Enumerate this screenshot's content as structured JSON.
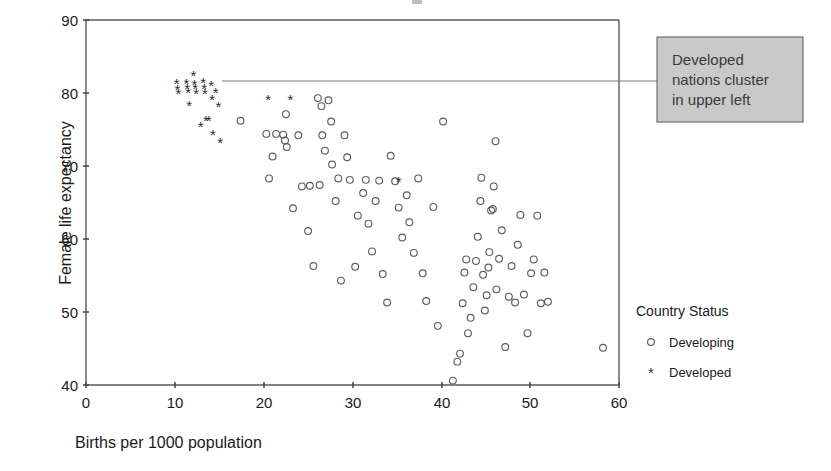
{
  "chart_data": {
    "type": "scatter",
    "title": "",
    "xlabel": "Births per 1000 population",
    "ylabel": "Female life expectancy",
    "xlim": [
      0,
      60
    ],
    "ylim": [
      40,
      90
    ],
    "xticks": [
      0,
      10,
      20,
      30,
      40,
      50,
      60
    ],
    "yticks": [
      40,
      50,
      60,
      70,
      80,
      90
    ],
    "grid": false,
    "legend_position": "right",
    "legend_title": "Country Status",
    "series": [
      {
        "name": "Developing",
        "marker": "circle",
        "color": "#5f5f5f",
        "points": [
          [
            17.4,
            76.2
          ],
          [
            20.3,
            74.4
          ],
          [
            20.6,
            68.3
          ],
          [
            21.0,
            71.3
          ],
          [
            21.4,
            74.4
          ],
          [
            22.2,
            74.3
          ],
          [
            22.4,
            73.5
          ],
          [
            22.5,
            77.1
          ],
          [
            22.6,
            72.6
          ],
          [
            23.3,
            64.2
          ],
          [
            23.9,
            74.2
          ],
          [
            24.3,
            67.2
          ],
          [
            25.0,
            61.1
          ],
          [
            25.2,
            67.3
          ],
          [
            25.6,
            56.3
          ],
          [
            26.1,
            79.3
          ],
          [
            26.3,
            67.4
          ],
          [
            26.5,
            78.2
          ],
          [
            26.6,
            74.2
          ],
          [
            26.9,
            72.1
          ],
          [
            27.3,
            79.0
          ],
          [
            27.6,
            76.1
          ],
          [
            27.7,
            70.2
          ],
          [
            28.1,
            65.2
          ],
          [
            28.4,
            68.3
          ],
          [
            28.7,
            54.3
          ],
          [
            29.1,
            74.2
          ],
          [
            29.4,
            71.2
          ],
          [
            29.7,
            68.1
          ],
          [
            30.3,
            56.2
          ],
          [
            30.6,
            63.2
          ],
          [
            31.2,
            66.3
          ],
          [
            31.5,
            68.1
          ],
          [
            31.8,
            62.1
          ],
          [
            32.2,
            58.3
          ],
          [
            32.6,
            65.2
          ],
          [
            33.0,
            68.0
          ],
          [
            33.4,
            55.2
          ],
          [
            33.9,
            51.3
          ],
          [
            34.3,
            71.4
          ],
          [
            34.8,
            67.9
          ],
          [
            35.2,
            64.3
          ],
          [
            35.6,
            60.2
          ],
          [
            36.1,
            66.0
          ],
          [
            36.4,
            62.3
          ],
          [
            36.9,
            58.1
          ],
          [
            37.4,
            68.3
          ],
          [
            37.9,
            55.3
          ],
          [
            38.3,
            51.5
          ],
          [
            39.1,
            64.4
          ],
          [
            39.6,
            48.1
          ],
          [
            40.2,
            76.1
          ],
          [
            41.3,
            40.6
          ],
          [
            41.8,
            43.2
          ],
          [
            42.1,
            44.3
          ],
          [
            42.4,
            51.2
          ],
          [
            42.6,
            55.4
          ],
          [
            42.8,
            57.2
          ],
          [
            43.0,
            47.1
          ],
          [
            43.3,
            49.2
          ],
          [
            43.6,
            53.4
          ],
          [
            43.9,
            57.0
          ],
          [
            44.1,
            60.3
          ],
          [
            44.4,
            65.2
          ],
          [
            44.5,
            68.4
          ],
          [
            44.7,
            55.1
          ],
          [
            44.9,
            50.2
          ],
          [
            45.1,
            52.3
          ],
          [
            45.3,
            56.1
          ],
          [
            45.4,
            58.2
          ],
          [
            45.6,
            63.9
          ],
          [
            45.8,
            64.1
          ],
          [
            45.9,
            67.2
          ],
          [
            46.1,
            73.4
          ],
          [
            46.2,
            53.1
          ],
          [
            46.5,
            57.3
          ],
          [
            46.8,
            61.2
          ],
          [
            47.2,
            45.2
          ],
          [
            47.6,
            52.1
          ],
          [
            47.9,
            56.3
          ],
          [
            48.3,
            51.3
          ],
          [
            48.6,
            59.2
          ],
          [
            48.9,
            63.3
          ],
          [
            49.3,
            52.4
          ],
          [
            49.7,
            47.1
          ],
          [
            50.1,
            55.3
          ],
          [
            50.4,
            57.2
          ],
          [
            50.8,
            63.2
          ],
          [
            51.2,
            51.2
          ],
          [
            51.6,
            55.4
          ],
          [
            52.0,
            51.4
          ],
          [
            58.2,
            45.1
          ]
        ]
      },
      {
        "name": "Developed",
        "marker": "star",
        "color": "#2e2e2e",
        "points": [
          [
            10.2,
            81.2
          ],
          [
            10.3,
            80.4
          ],
          [
            10.4,
            79.9
          ],
          [
            11.3,
            81.3
          ],
          [
            11.4,
            80.6
          ],
          [
            11.5,
            80.0
          ],
          [
            11.6,
            78.2
          ],
          [
            12.1,
            82.3
          ],
          [
            12.2,
            81.1
          ],
          [
            12.3,
            80.5
          ],
          [
            12.4,
            79.9
          ],
          [
            12.9,
            75.3
          ],
          [
            13.2,
            81.4
          ],
          [
            13.3,
            80.6
          ],
          [
            13.4,
            79.9
          ],
          [
            13.5,
            76.2
          ],
          [
            13.8,
            76.2
          ],
          [
            14.1,
            80.9
          ],
          [
            14.2,
            79.1
          ],
          [
            14.3,
            74.3
          ],
          [
            14.6,
            80.0
          ],
          [
            14.9,
            78.1
          ],
          [
            15.1,
            73.2
          ],
          [
            20.5,
            79.0
          ],
          [
            23.0,
            79.0
          ],
          [
            35.2,
            67.8
          ]
        ]
      }
    ],
    "annotations": [
      {
        "name": "developed-cluster-callout",
        "lines": [
          "Developed",
          "nations cluster",
          "in upper left"
        ],
        "box_fill": "#c9c9c9",
        "box_stroke": "#6e6e6e",
        "leader_from": [
          14.8,
          81.5
        ],
        "leader_to_px": [
          657,
          81
        ]
      }
    ]
  },
  "axes": {
    "x": {
      "label": "Births per 1000 population",
      "ticks": [
        "0",
        "10",
        "20",
        "30",
        "40",
        "50",
        "60"
      ]
    },
    "y": {
      "label": "Female life expectancy",
      "ticks": [
        "40",
        "50",
        "60",
        "70",
        "80",
        "90"
      ]
    }
  },
  "legend": {
    "title": "Country Status",
    "entries": [
      {
        "label": "Developing",
        "marker": "circle-marker"
      },
      {
        "label": "Developed",
        "marker": "star-marker"
      }
    ]
  }
}
